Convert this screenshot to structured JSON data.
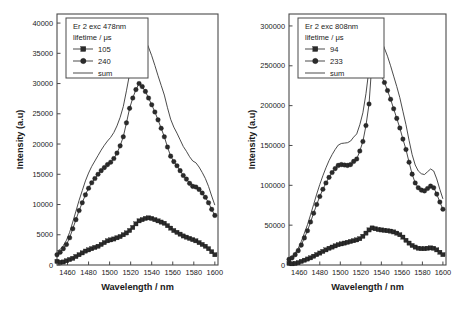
{
  "figure": {
    "background": "#ffffff",
    "ink_color": "#2b2b2b"
  },
  "chart_data": [
    {
      "type": "line",
      "panel": "left",
      "title": "",
      "legend_title": "Er 2 exc 478nm",
      "legend_subtitle": "lifetime / μs",
      "legend_position": "top-left-inside",
      "xlabel": "Wavelength / nm",
      "ylabel": "Intensity (a.u)",
      "xlim": [
        1450,
        1603
      ],
      "ylim": [
        0,
        41500
      ],
      "xticks": [
        1460,
        1480,
        1500,
        1520,
        1540,
        1560,
        1580,
        1600
      ],
      "yticks": [
        0,
        5000,
        10000,
        15000,
        20000,
        25000,
        30000,
        35000,
        40000
      ],
      "grid": false,
      "x": [
        1450,
        1453,
        1456,
        1459,
        1462,
        1465,
        1468,
        1471,
        1474,
        1477,
        1480,
        1483,
        1486,
        1489,
        1492,
        1495,
        1498,
        1501,
        1504,
        1507,
        1510,
        1513,
        1516,
        1519,
        1522,
        1525,
        1528,
        1531,
        1534,
        1537,
        1540,
        1543,
        1546,
        1549,
        1552,
        1555,
        1558,
        1561,
        1564,
        1567,
        1570,
        1573,
        1576,
        1579,
        1582,
        1585,
        1588,
        1591,
        1594,
        1597,
        1600
      ],
      "series": [
        {
          "name": "105",
          "marker": "square",
          "values": [
            600,
            450,
            500,
            700,
            900,
            1100,
            1400,
            1700,
            2000,
            2300,
            2500,
            2700,
            2900,
            3100,
            3400,
            3700,
            4000,
            4150,
            4300,
            4500,
            4700,
            5000,
            5300,
            5700,
            6200,
            6800,
            7300,
            7500,
            7700,
            7800,
            7700,
            7500,
            7300,
            7100,
            6900,
            6500,
            6100,
            5700,
            5400,
            5100,
            4800,
            4600,
            4400,
            4200,
            4000,
            3700,
            3400,
            3100,
            2700,
            2200,
            1700
          ]
        },
        {
          "name": "240",
          "marker": "circle",
          "values": [
            1700,
            2100,
            2700,
            3400,
            4500,
            6000,
            7500,
            9000,
            10300,
            11600,
            12700,
            13600,
            14300,
            15000,
            15600,
            16100,
            16600,
            17000,
            17600,
            18500,
            19700,
            21200,
            23500,
            25900,
            27600,
            29000,
            30000,
            29500,
            28700,
            27600,
            26500,
            25300,
            24000,
            22600,
            21200,
            19500,
            18000,
            17100,
            16400,
            15600,
            14800,
            14200,
            13500,
            13000,
            12900,
            12500,
            11900,
            11200,
            10300,
            9200,
            8200
          ]
        },
        {
          "name": "sum",
          "marker": "none",
          "values": [
            2300,
            2550,
            3200,
            4100,
            5400,
            7100,
            8900,
            10700,
            12300,
            13900,
            15200,
            16300,
            17200,
            18100,
            19000,
            19800,
            20500,
            21100,
            21900,
            23000,
            24400,
            26200,
            28800,
            31600,
            33800,
            35800,
            37300,
            38000,
            37200,
            36000,
            34600,
            33000,
            31300,
            29700,
            28100,
            26000,
            24100,
            22800,
            21800,
            20700,
            19600,
            18800,
            17900,
            17200,
            16900,
            16200,
            15300,
            14300,
            13000,
            11400,
            9900
          ]
        }
      ]
    },
    {
      "type": "line",
      "panel": "right",
      "title": "",
      "legend_title": "Er 2 exc 808nm",
      "legend_subtitle": "lifetime / μs",
      "legend_position": "top-left-inside",
      "xlabel": "Wavelength / nm",
      "ylabel": "Intensity (a.u)",
      "xlim": [
        1450,
        1603
      ],
      "ylim": [
        0,
        315000
      ],
      "xticks": [
        1460,
        1480,
        1500,
        1520,
        1540,
        1560,
        1580,
        1600
      ],
      "yticks": [
        0,
        50000,
        100000,
        150000,
        200000,
        250000,
        300000
      ],
      "grid": false,
      "x": [
        1450,
        1453,
        1456,
        1459,
        1462,
        1465,
        1468,
        1471,
        1474,
        1477,
        1480,
        1483,
        1486,
        1489,
        1492,
        1495,
        1498,
        1501,
        1504,
        1507,
        1510,
        1513,
        1516,
        1519,
        1522,
        1525,
        1528,
        1531,
        1534,
        1537,
        1540,
        1543,
        1546,
        1549,
        1552,
        1555,
        1558,
        1561,
        1564,
        1567,
        1570,
        1573,
        1576,
        1579,
        1582,
        1585,
        1588,
        1591,
        1594,
        1597,
        1600
      ],
      "series": [
        {
          "name": "94",
          "marker": "square",
          "values": [
            2000,
            1500,
            2000,
            3000,
            4500,
            6000,
            7500,
            9000,
            11000,
            13000,
            15000,
            17000,
            19000,
            21000,
            22500,
            24000,
            25500,
            26500,
            27500,
            28500,
            29500,
            30500,
            31500,
            33000,
            36000,
            40000,
            44000,
            46500,
            45500,
            44500,
            44000,
            43500,
            43000,
            42500,
            41500,
            40000,
            38000,
            35000,
            31000,
            27500,
            24500,
            22500,
            21000,
            20500,
            20500,
            21000,
            21500,
            21000,
            19000,
            16000,
            13000
          ]
        },
        {
          "name": "233",
          "marker": "circle",
          "values": [
            7000,
            9000,
            13000,
            18000,
            25000,
            34000,
            43000,
            54000,
            65000,
            76000,
            86000,
            95000,
            103000,
            110000,
            116000,
            121000,
            125000,
            126000,
            125500,
            125000,
            126000,
            130000,
            133000,
            143000,
            155000,
            175000,
            202000,
            257000,
            253000,
            245000,
            238000,
            229000,
            219000,
            208000,
            196000,
            184000,
            172000,
            158000,
            145000,
            129000,
            114000,
            103000,
            97000,
            94000,
            93000,
            96000,
            99000,
            97000,
            89000,
            79000,
            70000
          ]
        },
        {
          "name": "sum",
          "marker": "none",
          "values": [
            9000,
            10500,
            15000,
            21000,
            29500,
            40000,
            50500,
            63000,
            76000,
            89000,
            101000,
            112000,
            122000,
            131000,
            138500,
            145000,
            150500,
            152500,
            153000,
            153500,
            155500,
            160500,
            164500,
            176000,
            191000,
            215000,
            246000,
            303000,
            298000,
            289000,
            282000,
            272000,
            262000,
            250000,
            237000,
            224000,
            210000,
            193000,
            176000,
            156500,
            138500,
            125500,
            118000,
            114500,
            113500,
            117000,
            120500,
            118000,
            108000,
            95000,
            83000
          ]
        }
      ]
    }
  ],
  "left_chart": {
    "legend": {
      "title": "Er 2 exc 478nm",
      "subtitle": "lifetime / μs",
      "entry1": "105",
      "entry2": "240",
      "entry3": "sum"
    },
    "ylabel": "Intensity (a.u)",
    "xlabel": "Wavelength / nm",
    "yticklabels": [
      "0",
      "5000",
      "10000",
      "15000",
      "20000",
      "25000",
      "30000",
      "35000",
      "40000"
    ],
    "xticklabels": [
      "1460",
      "1480",
      "1500",
      "1520",
      "1540",
      "1560",
      "1580",
      "1600"
    ]
  },
  "right_chart": {
    "legend": {
      "title": "Er 2 exc 808nm",
      "subtitle": "lifetime / μs",
      "entry1": "94",
      "entry2": "233",
      "entry3": "sum"
    },
    "ylabel": "Intensity (a.u)",
    "xlabel": "Wavelength / nm",
    "yticklabels": [
      "0",
      "50000",
      "100000",
      "150000",
      "200000",
      "250000",
      "300000"
    ],
    "xticklabels": [
      "1460",
      "1480",
      "1500",
      "1520",
      "1540",
      "1560",
      "1580",
      "1600"
    ]
  }
}
